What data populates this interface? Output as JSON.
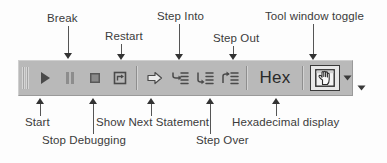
{
  "figure": {
    "colors": {
      "toolbar_face": "#b9b9b9",
      "icon_dark": "#4a4a4a",
      "accent_arrow": "#333333",
      "label_text": "#3b3b3b"
    }
  },
  "toolbar": {
    "name": "Debug toolbar",
    "buttons": [
      {
        "id": "start",
        "icon": "play-icon",
        "tooltip": "Start"
      },
      {
        "id": "break",
        "icon": "pause-icon",
        "tooltip": "Break"
      },
      {
        "id": "stop-debugging",
        "icon": "stop-square-icon",
        "tooltip": "Stop Debugging"
      },
      {
        "id": "restart",
        "icon": "restart-icon",
        "tooltip": "Restart"
      },
      {
        "id": "show-next-statement",
        "icon": "right-arrow-icon",
        "tooltip": "Show Next Statement"
      },
      {
        "id": "step-into",
        "icon": "step-into-icon",
        "tooltip": "Step Into"
      },
      {
        "id": "step-over",
        "icon": "step-over-icon",
        "tooltip": "Step Over"
      },
      {
        "id": "step-out",
        "icon": "step-out-icon",
        "tooltip": "Step Out"
      }
    ],
    "hex_button": {
      "label": "Hex",
      "tooltip": "Hexadecimal display"
    },
    "tool_window_toggle": {
      "icon": "tool-window-hand-icon",
      "tooltip": "Tool window toggle"
    },
    "overflow_caret": {
      "icon": "chevron-down-icon"
    },
    "toolbar_options_caret": {
      "icon": "chevron-down-icon"
    },
    "grip": {
      "icon": "drag-grip-icon"
    }
  },
  "callouts": {
    "top": [
      {
        "id": "break",
        "label": "Break"
      },
      {
        "id": "restart",
        "label": "Restart"
      },
      {
        "id": "step-into",
        "label": "Step Into"
      },
      {
        "id": "step-out",
        "label": "Step Out"
      },
      {
        "id": "tool-window-toggle",
        "label": "Tool window toggle"
      }
    ],
    "bottom": [
      {
        "id": "start",
        "label": "Start"
      },
      {
        "id": "stop-debugging",
        "label": "Stop Debugging"
      },
      {
        "id": "show-next-statement",
        "label": "Show Next Statement"
      },
      {
        "id": "step-over",
        "label": "Step Over"
      },
      {
        "id": "hexadecimal-display",
        "label": "Hexadecimal display"
      }
    ]
  }
}
